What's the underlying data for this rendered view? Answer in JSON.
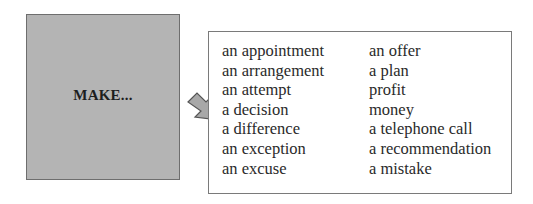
{
  "make_box": {
    "label": "MAKE...",
    "background": "#b4b4b4"
  },
  "arrow": {
    "icon": "block-arrow-down-right-icon",
    "fill": "#a8a8a8",
    "stroke": "#555555"
  },
  "collocations": {
    "left_column": [
      "an appointment",
      "an arrangement",
      "an attempt",
      "a decision",
      "a difference",
      "an exception",
      "an excuse"
    ],
    "right_column": [
      "an offer",
      "a plan",
      "profit",
      "money",
      "a telephone call",
      "a recommendation",
      "a mistake"
    ]
  }
}
